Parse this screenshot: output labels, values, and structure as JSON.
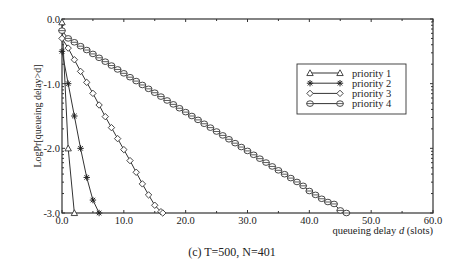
{
  "chart_data": {
    "type": "line",
    "title": "",
    "caption": "(c) T=500, N=401",
    "xlabel": "queueing delay d (slots)",
    "xlabel_parts": [
      "queueing delay ",
      "d",
      " (slots)"
    ],
    "ylabel": "LogPr[queueing delay>d]",
    "xlim": [
      0,
      60
    ],
    "ylim": [
      -3,
      0
    ],
    "xticks": [
      0,
      10,
      20,
      30,
      40,
      50,
      60
    ],
    "xtick_labels": [
      "0.0",
      "10.0",
      "20.0",
      "30.0",
      "40.0",
      "50.0",
      "60.0"
    ],
    "yticks": [
      0,
      -1,
      -2,
      -3
    ],
    "ytick_labels": [
      "0.0",
      "-1.0",
      "-2.0",
      "-3.0"
    ],
    "grid": false,
    "legend_position": "upper right (inside)",
    "series": [
      {
        "name": "priority 1",
        "marker": "triangle",
        "x": [
          0,
          1,
          2
        ],
        "y": [
          -0.05,
          -2.0,
          -3.0
        ]
      },
      {
        "name": "priority 2",
        "marker": "star",
        "x": [
          0,
          1,
          2,
          3,
          4,
          5,
          6
        ],
        "y": [
          -0.5,
          -1.0,
          -1.5,
          -2.0,
          -2.45,
          -2.8,
          -3.0
        ]
      },
      {
        "name": "priority 3",
        "marker": "diamond",
        "x": [
          0,
          1,
          2,
          3,
          4,
          5,
          6,
          7,
          8,
          9,
          10,
          11,
          12,
          13,
          14,
          15,
          16,
          16.3
        ],
        "y": [
          -0.3,
          -0.45,
          -0.63,
          -0.81,
          -0.98,
          -1.15,
          -1.33,
          -1.51,
          -1.68,
          -1.85,
          -2.02,
          -2.19,
          -2.37,
          -2.55,
          -2.72,
          -2.88,
          -2.98,
          -3.0
        ]
      },
      {
        "name": "priority 4",
        "marker": "circle",
        "x": [
          0,
          1,
          2,
          3,
          4,
          5,
          6,
          7,
          8,
          9,
          10,
          11,
          12,
          13,
          14,
          15,
          16,
          17,
          18,
          19,
          20,
          21,
          22,
          23,
          24,
          25,
          26,
          27,
          28,
          29,
          30,
          31,
          32,
          33,
          34,
          35,
          36,
          37,
          38,
          39,
          40,
          41,
          42,
          43,
          44,
          45,
          46
        ],
        "y": [
          -0.18,
          -0.3,
          -0.36,
          -0.42,
          -0.48,
          -0.54,
          -0.6,
          -0.66,
          -0.72,
          -0.78,
          -0.84,
          -0.9,
          -0.96,
          -1.02,
          -1.08,
          -1.14,
          -1.2,
          -1.26,
          -1.32,
          -1.38,
          -1.44,
          -1.5,
          -1.56,
          -1.62,
          -1.68,
          -1.74,
          -1.8,
          -1.86,
          -1.92,
          -1.98,
          -2.04,
          -2.1,
          -2.16,
          -2.22,
          -2.28,
          -2.34,
          -2.4,
          -2.46,
          -2.52,
          -2.58,
          -2.66,
          -2.72,
          -2.78,
          -2.83,
          -2.86,
          -2.96,
          -3.0
        ]
      }
    ]
  }
}
